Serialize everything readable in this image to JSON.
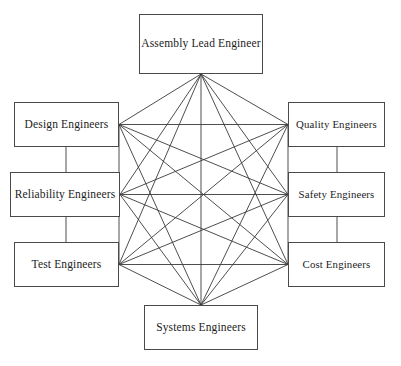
{
  "diagram": {
    "type": "complete-graph",
    "background_color": "#ffffff",
    "node_border_color": "#4a4a4a",
    "node_fill_color": "#ffffff",
    "edge_color": "#3a3a3a",
    "text_color": "#1c1c1c",
    "node_count": 8,
    "edge_count": 28,
    "nodes": [
      {
        "id": "assembly_lead",
        "label": "Assembly Lead Engineer",
        "x": 139,
        "y": 14,
        "w": 124,
        "h": 60,
        "position": "top"
      },
      {
        "id": "design",
        "label": "Design Engineers",
        "x": 14,
        "y": 102,
        "w": 105,
        "h": 45,
        "position": "left-top"
      },
      {
        "id": "reliability",
        "label": "Reliability Engineers",
        "x": 10,
        "y": 172,
        "w": 110,
        "h": 45,
        "position": "left-middle"
      },
      {
        "id": "test",
        "label": "Test Engineers",
        "x": 14,
        "y": 242,
        "w": 105,
        "h": 45,
        "position": "left-bottom"
      },
      {
        "id": "quality",
        "label": "Quality Engineers",
        "x": 288,
        "y": 102,
        "w": 97,
        "h": 45,
        "position": "right-top"
      },
      {
        "id": "safety",
        "label": "Safety Engineers",
        "x": 288,
        "y": 172,
        "w": 97,
        "h": 45,
        "position": "right-middle"
      },
      {
        "id": "cost",
        "label": "Cost Engineers",
        "x": 288,
        "y": 242,
        "w": 97,
        "h": 45,
        "position": "right-bottom"
      },
      {
        "id": "systems",
        "label": "Systems Engineers",
        "x": 144,
        "y": 305,
        "w": 114,
        "h": 45,
        "position": "bottom"
      }
    ],
    "edges": [
      {
        "from": "assembly_lead",
        "to": "design"
      },
      {
        "from": "assembly_lead",
        "to": "reliability"
      },
      {
        "from": "assembly_lead",
        "to": "test"
      },
      {
        "from": "assembly_lead",
        "to": "quality"
      },
      {
        "from": "assembly_lead",
        "to": "safety"
      },
      {
        "from": "assembly_lead",
        "to": "cost"
      },
      {
        "from": "assembly_lead",
        "to": "systems"
      },
      {
        "from": "design",
        "to": "reliability"
      },
      {
        "from": "design",
        "to": "test"
      },
      {
        "from": "design",
        "to": "quality"
      },
      {
        "from": "design",
        "to": "safety"
      },
      {
        "from": "design",
        "to": "cost"
      },
      {
        "from": "design",
        "to": "systems"
      },
      {
        "from": "reliability",
        "to": "test"
      },
      {
        "from": "reliability",
        "to": "quality"
      },
      {
        "from": "reliability",
        "to": "safety"
      },
      {
        "from": "reliability",
        "to": "cost"
      },
      {
        "from": "reliability",
        "to": "systems"
      },
      {
        "from": "test",
        "to": "quality"
      },
      {
        "from": "test",
        "to": "safety"
      },
      {
        "from": "test",
        "to": "cost"
      },
      {
        "from": "test",
        "to": "systems"
      },
      {
        "from": "quality",
        "to": "safety"
      },
      {
        "from": "quality",
        "to": "cost"
      },
      {
        "from": "quality",
        "to": "systems"
      },
      {
        "from": "safety",
        "to": "cost"
      },
      {
        "from": "safety",
        "to": "systems"
      },
      {
        "from": "cost",
        "to": "systems"
      }
    ]
  }
}
